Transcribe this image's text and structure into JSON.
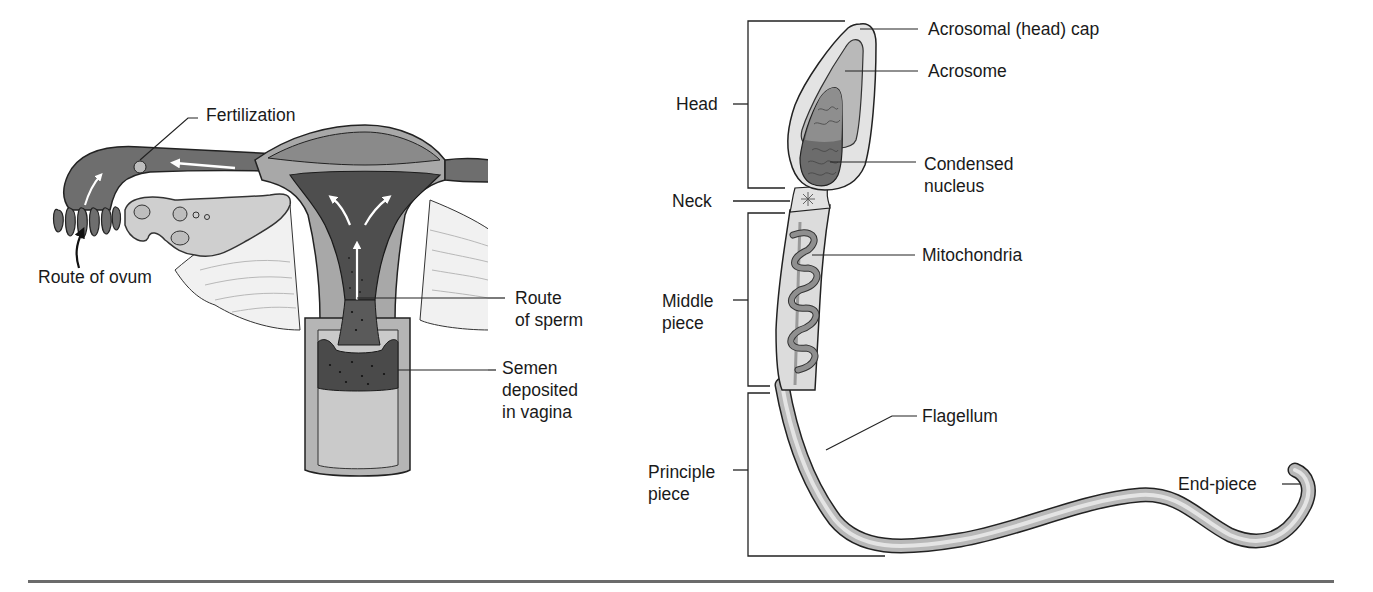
{
  "figure": {
    "left_panel": {
      "title": "Female reproductive tract — route of sperm and ovum",
      "labels": {
        "fertilization": "Fertilization",
        "route_of_ovum": "Route of ovum",
        "route_of_sperm": "Route\nof sperm",
        "semen_deposited": "Semen\ndeposited\nin vagina"
      }
    },
    "right_panel": {
      "title": "Sperm cell structure",
      "region_labels": {
        "head": "Head",
        "neck": "Neck",
        "middle_piece": "Middle\npiece",
        "principle_piece": "Principle\npiece"
      },
      "part_labels": {
        "acrosomal_cap": "Acrosomal (head) cap",
        "acrosome": "Acrosome",
        "condensed_nucleus": "Condensed\nnucleus",
        "mitochondria": "Mitochondria",
        "flagellum": "Flagellum",
        "end_piece": "End-piece"
      }
    },
    "colors": {
      "outline": "#2a2a2a",
      "dark_fill": "#5a5a5a",
      "mid_fill": "#9a9a9a",
      "light_fill": "#c8c8c8",
      "pale_fill": "#e2e2e2",
      "rule": "#6b6b6b"
    }
  }
}
